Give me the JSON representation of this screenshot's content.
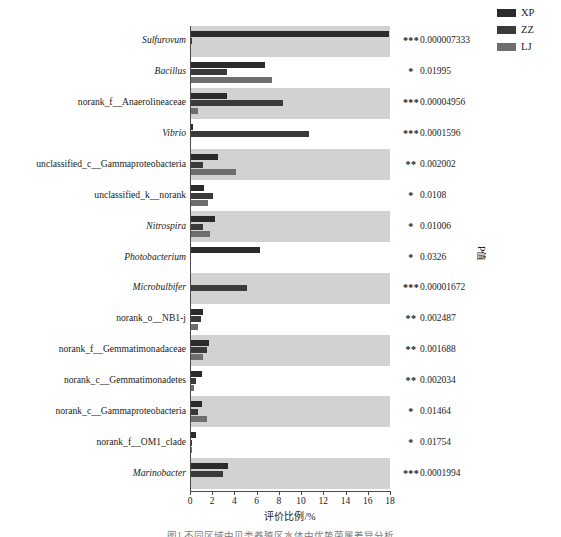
{
  "legend": {
    "items": [
      {
        "label": "XP",
        "color": "#2b2b2b"
      },
      {
        "label": "ZZ",
        "color": "#3a3a3a"
      },
      {
        "label": "LJ",
        "color": "#6e6e6e"
      }
    ]
  },
  "axis": {
    "x_title": "评价比例/%",
    "p_title": "P值",
    "ticks": [
      "0",
      "2",
      "4",
      "6",
      "8",
      "10",
      "12",
      "14",
      "16",
      "18"
    ]
  },
  "caption": "图1  不同区域中贝类养殖区水体中优势菌属差异分析",
  "chart_data": {
    "type": "bar",
    "orientation": "horizontal",
    "title": "",
    "xlabel": "评价比例/%",
    "ylabel": "",
    "xlim": [
      0,
      18
    ],
    "grid": false,
    "legend_position": "top-right",
    "categories": [
      "Sulfurovum",
      "Bacillus",
      "norank_f__Anaerolineaceae",
      "Vibrio",
      "unclassified_c__Gammaproteobacteria",
      "unclassified_k__norank",
      "Nitrospira",
      "Photobacterium",
      "Microbulbifer",
      "norank_o__NB1-j",
      "norank_f__Gemmatimonadaceae",
      "norank_c__Gemmatimonadetes",
      "norank_c__Gammaproteobacteria",
      "norank_f__OM1_clade",
      "Marinobacter"
    ],
    "italic_flags": [
      true,
      true,
      false,
      true,
      false,
      false,
      true,
      true,
      true,
      false,
      false,
      false,
      false,
      false,
      true
    ],
    "series": [
      {
        "name": "XP",
        "color": "#2b2b2b",
        "values": [
          17.95,
          6.75,
          3.35,
          0.3,
          2.55,
          1.3,
          2.25,
          6.3,
          0.1,
          1.2,
          1.75,
          1.05,
          1.1,
          0.55,
          3.45
        ]
      },
      {
        "name": "ZZ",
        "color": "#3a3a3a",
        "values": [
          0.18,
          3.3,
          8.35,
          10.75,
          1.15,
          2.1,
          1.15,
          0.08,
          5.15,
          0.95,
          1.55,
          0.55,
          0.75,
          0.2,
          2.95
        ]
      },
      {
        "name": "LJ",
        "color": "#6e6e6e",
        "values": [
          0.05,
          7.35,
          0.7,
          0.06,
          4.1,
          1.6,
          1.8,
          0.05,
          0.1,
          0.75,
          1.15,
          0.35,
          1.5,
          0.15,
          0.1
        ]
      }
    ],
    "significance": [
      "***",
      "*",
      "***",
      "***",
      "**",
      "*",
      "*",
      "*",
      "***",
      "**",
      "**",
      "**",
      "*",
      "*",
      "***"
    ],
    "p_values": [
      "0.000007333",
      "0.01995",
      "0.00004956",
      "0.0001596",
      "0.002002",
      "0.0108",
      "0.01006",
      "0.0326",
      "0.00001672",
      "0.002487",
      "0.001688",
      "0.002034",
      "0.01464",
      "0.01754",
      "0.0001994"
    ]
  }
}
